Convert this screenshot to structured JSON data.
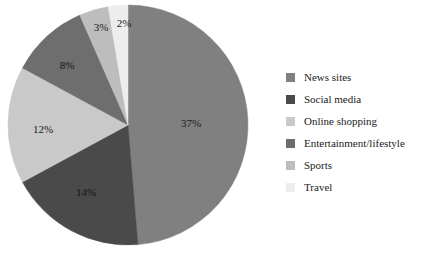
{
  "background_color": "#ffffff",
  "chart_data": {
    "type": "pie",
    "title": "",
    "subtitle": "",
    "xlabel": "",
    "ylabel": "",
    "grid": false,
    "legend_position": "right",
    "start_angle_deg": 0,
    "direction": "clockwise",
    "center": {
      "x": 128,
      "y": 125
    },
    "radius": 120,
    "categories": [
      "News sites",
      "Social media",
      "Online shopping",
      "Entertainment/lifestyle",
      "Sports",
      "Travel"
    ],
    "values": [
      37,
      14,
      12,
      8,
      3,
      2
    ],
    "value_unit": "%",
    "data_labels": [
      "37%",
      "14%",
      "12%",
      "8%",
      "3%",
      "2%"
    ],
    "colors": [
      "#808080",
      "#4a4a4a",
      "#c9c9c9",
      "#6e6e6e",
      "#bdbdbd",
      "#ededed"
    ],
    "slices": [
      {
        "label": "News sites",
        "value": 37,
        "data_label": "37%",
        "color": "#808080",
        "label_x": 191,
        "label_y": 124,
        "on_dark": false
      },
      {
        "label": "Social media",
        "value": 14,
        "data_label": "14%",
        "color": "#4a4a4a",
        "label_x": 86,
        "label_y": 193,
        "on_dark": true
      },
      {
        "label": "Online shopping",
        "value": 12,
        "data_label": "12%",
        "color": "#c9c9c9",
        "label_x": 43,
        "label_y": 130,
        "on_dark": false
      },
      {
        "label": "Entertainment/lifestyle",
        "value": 8,
        "data_label": "8%",
        "color": "#6e6e6e",
        "label_x": 67,
        "label_y": 66,
        "on_dark": true
      },
      {
        "label": "Sports",
        "value": 3,
        "data_label": "3%",
        "color": "#bdbdbd",
        "label_x": 101,
        "label_y": 28,
        "on_dark": false
      },
      {
        "label": "Travel",
        "value": 2,
        "data_label": "2%",
        "color": "#ededed",
        "label_x": 124,
        "label_y": 24,
        "on_dark": false
      }
    ]
  },
  "legend": {
    "items": [
      {
        "label": "News sites",
        "color": "#808080"
      },
      {
        "label": "Social media",
        "color": "#4a4a4a"
      },
      {
        "label": "Online shopping",
        "color": "#c9c9c9"
      },
      {
        "label": "Entertainment/lifestyle",
        "color": "#6e6e6e"
      },
      {
        "label": "Sports",
        "color": "#bdbdbd"
      },
      {
        "label": "Travel",
        "color": "#ededed"
      }
    ]
  }
}
